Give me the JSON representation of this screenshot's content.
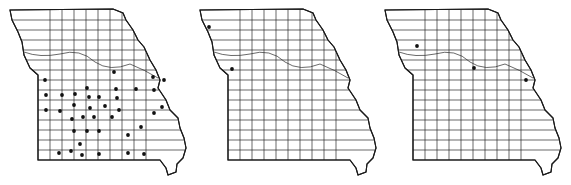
{
  "figure": {
    "panels": [
      {
        "id": "map-1",
        "offset_x": 0,
        "dots": [
          [
            114,
            72
          ],
          [
            153,
            77
          ],
          [
            164,
            80
          ],
          [
            45,
            80
          ],
          [
            87,
            88
          ],
          [
            116,
            89
          ],
          [
            136,
            89
          ],
          [
            154,
            90
          ],
          [
            46,
            95
          ],
          [
            62,
            95
          ],
          [
            75,
            94
          ],
          [
            89,
            97
          ],
          [
            99,
            97
          ],
          [
            117,
            98
          ],
          [
            162,
            107
          ],
          [
            46,
            110
          ],
          [
            74,
            105
          ],
          [
            60,
            111
          ],
          [
            90,
            108
          ],
          [
            105,
            106
          ],
          [
            119,
            110
          ],
          [
            154,
            113
          ],
          [
            72,
            119
          ],
          [
            83,
            117
          ],
          [
            94,
            117
          ],
          [
            112,
            117
          ],
          [
            141,
            127
          ],
          [
            74,
            131
          ],
          [
            87,
            131
          ],
          [
            99,
            131
          ],
          [
            128,
            135
          ],
          [
            80,
            144
          ],
          [
            59,
            153
          ],
          [
            71,
            151
          ],
          [
            82,
            155
          ],
          [
            99,
            154
          ],
          [
            128,
            153
          ],
          [
            144,
            154
          ]
        ]
      },
      {
        "id": "map-2",
        "offset_x": 190,
        "dots": [
          [
            209,
            27
          ],
          [
            232,
            69
          ]
        ]
      },
      {
        "id": "map-3",
        "offset_x": 375,
        "dots": [
          [
            417,
            46
          ],
          [
            474,
            68
          ],
          [
            526,
            80
          ]
        ]
      }
    ]
  }
}
